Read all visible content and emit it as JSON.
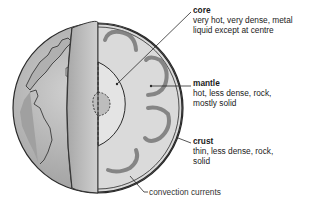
{
  "diagram": {
    "colors": {
      "background": "#ffffff",
      "surface": "#b8b8b8",
      "mantle": "#dedede",
      "convection": "#777777",
      "core": "#e6e6e6",
      "inner_core": "#bdbdbd",
      "outline": "#2a2a2a"
    },
    "labels": {
      "core": {
        "title": "core",
        "lines": [
          "very hot, very dense, metal",
          "liquid except at centre"
        ]
      },
      "mantle": {
        "title": "mantle",
        "lines": [
          "hot, less dense, rock,",
          "mostly solid"
        ]
      },
      "crust": {
        "title": "crust",
        "lines": [
          "thin, less dense, rock,",
          "solid"
        ]
      },
      "convection": {
        "title": "convection currents"
      }
    }
  }
}
